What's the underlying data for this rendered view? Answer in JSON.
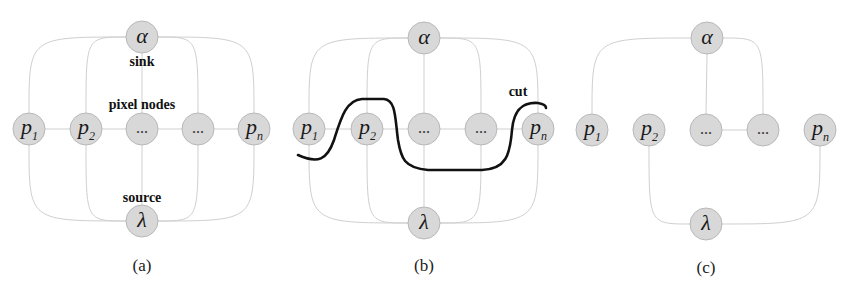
{
  "figure": {
    "colors": {
      "node_fill": "#d8d8d8",
      "node_stroke": "#b8b8b8",
      "edge": "#cfcfcf",
      "cut": "#111111"
    },
    "panels": [
      {
        "id": "a",
        "caption": "(a)",
        "nodes": {
          "alpha": {
            "label": "α"
          },
          "lambda": {
            "label": "λ"
          },
          "p1": {
            "label": "p",
            "sub": "1"
          },
          "p2": {
            "label": "p",
            "sub": "2"
          },
          "d1": {
            "label": "..."
          },
          "d2": {
            "label": "..."
          },
          "pn": {
            "label": "p",
            "sub": "n"
          }
        },
        "annotations": {
          "sink": "sink",
          "pixel_nodes": "pixel nodes",
          "source": "source"
        },
        "edges": [
          [
            "alpha",
            "p1"
          ],
          [
            "alpha",
            "p2"
          ],
          [
            "alpha",
            "d1"
          ],
          [
            "alpha",
            "d2"
          ],
          [
            "alpha",
            "pn"
          ],
          [
            "lambda",
            "p1"
          ],
          [
            "lambda",
            "p2"
          ],
          [
            "lambda",
            "d1"
          ],
          [
            "lambda",
            "d2"
          ],
          [
            "lambda",
            "pn"
          ],
          [
            "p1",
            "p2"
          ],
          [
            "p2",
            "d1"
          ],
          [
            "d1",
            "d2"
          ],
          [
            "d2",
            "pn"
          ]
        ]
      },
      {
        "id": "b",
        "caption": "(b)",
        "nodes": {
          "alpha": {
            "label": "α"
          },
          "lambda": {
            "label": "λ"
          },
          "p1": {
            "label": "p",
            "sub": "1"
          },
          "p2": {
            "label": "p",
            "sub": "2"
          },
          "d1": {
            "label": "..."
          },
          "d2": {
            "label": "..."
          },
          "pn": {
            "label": "p",
            "sub": "n"
          }
        },
        "annotations": {
          "cut": "cut"
        },
        "edges": [
          [
            "alpha",
            "p1"
          ],
          [
            "alpha",
            "p2"
          ],
          [
            "alpha",
            "d1"
          ],
          [
            "alpha",
            "d2"
          ],
          [
            "alpha",
            "pn"
          ],
          [
            "lambda",
            "p1"
          ],
          [
            "lambda",
            "p2"
          ],
          [
            "lambda",
            "d1"
          ],
          [
            "lambda",
            "d2"
          ],
          [
            "lambda",
            "pn"
          ],
          [
            "p1",
            "p2"
          ],
          [
            "p2",
            "d1"
          ],
          [
            "d1",
            "d2"
          ],
          [
            "d2",
            "pn"
          ]
        ]
      },
      {
        "id": "c",
        "caption": "(c)",
        "nodes": {
          "alpha": {
            "label": "α"
          },
          "lambda": {
            "label": "λ"
          },
          "p1": {
            "label": "p",
            "sub": "1"
          },
          "p2": {
            "label": "p",
            "sub": "2"
          },
          "d1": {
            "label": "..."
          },
          "d2": {
            "label": "..."
          },
          "pn": {
            "label": "p",
            "sub": "n"
          }
        },
        "edges": [
          [
            "alpha",
            "p1"
          ],
          [
            "alpha",
            "d1"
          ],
          [
            "alpha",
            "d2"
          ],
          [
            "lambda",
            "p2"
          ],
          [
            "lambda",
            "pn"
          ],
          [
            "d1",
            "d2"
          ]
        ]
      }
    ]
  }
}
